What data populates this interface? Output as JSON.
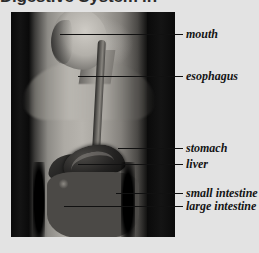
{
  "page": {
    "heading": "Digestive System in Motion",
    "background_color": "#e3e3e3"
  },
  "figure": {
    "name": "human-digestive-system-diagram",
    "panel_color": "#000000"
  },
  "labels": [
    {
      "id": "mouth",
      "text": "mouth",
      "top": 28,
      "leader_start_x": 60,
      "leader_y": 34
    },
    {
      "id": "esophagus",
      "text": "esophagus",
      "top": 70,
      "leader_start_x": 78,
      "leader_y": 76
    },
    {
      "id": "stomach",
      "text": "stomach",
      "top": 142,
      "leader_start_x": 118,
      "leader_y": 148
    },
    {
      "id": "liver",
      "text": "liver",
      "top": 158,
      "leader_start_x": 78,
      "leader_y": 164
    },
    {
      "id": "small-intestine",
      "text": "small intestine",
      "top": 187,
      "leader_start_x": 116,
      "leader_y": 193
    },
    {
      "id": "large-intestine",
      "text": "large intestine",
      "top": 200,
      "leader_start_x": 64,
      "leader_y": 206
    }
  ],
  "colors": {
    "label_text": "#141414",
    "leader_line": "#111111",
    "page_background": "#e3e3e3",
    "panel_background": "#000000"
  }
}
